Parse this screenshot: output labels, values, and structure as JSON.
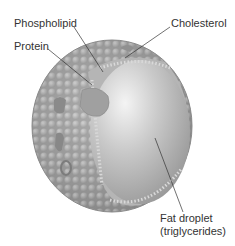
{
  "diagram": {
    "labels": {
      "phospholipid": "Phospholipid",
      "cholesterol": "Cholesterol",
      "protein": "Protein",
      "fat_droplet_line1": "Fat droplet",
      "fat_droplet_line2": "(triglycerides)"
    },
    "colors": {
      "shell": "#a8a8a8",
      "core": "#c8c8c8",
      "line": "#333333",
      "text": "#333333"
    }
  }
}
